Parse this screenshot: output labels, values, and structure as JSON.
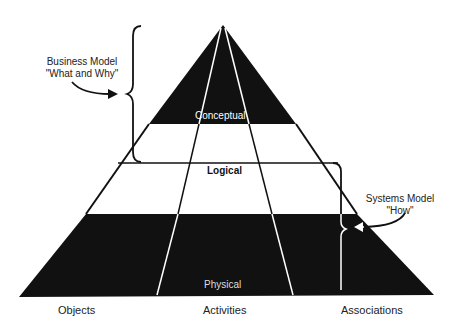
{
  "diagram": {
    "layers": [
      {
        "name": "Conceptual",
        "fill": "#111111",
        "text_color": "#ffffff"
      },
      {
        "name": "Logical",
        "fill": "#ffffff",
        "text_color": "#111111"
      },
      {
        "name": "Physical",
        "fill": "#111111",
        "text_color": "#ffffff"
      }
    ],
    "columns": [
      "Objects",
      "Activities",
      "Associations"
    ],
    "annotations": {
      "business_model": {
        "line1": "Business Model",
        "line2": "\"What and Why\""
      },
      "systems_model": {
        "line1": "Systems Model",
        "line2": "\"How\""
      }
    }
  }
}
